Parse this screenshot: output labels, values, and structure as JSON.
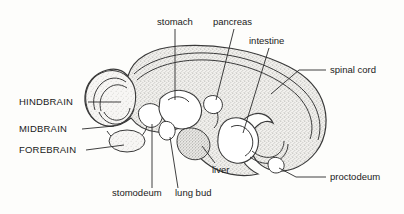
{
  "figure": {
    "background_color": "#fdfdfb",
    "ink_color": "#3a3a3a",
    "stipple_color": "#9a9a96"
  },
  "labels": {
    "stomach": "stomach",
    "pancreas": "pancreas",
    "intestine": "intestine",
    "spinal_cord": "spinal cord",
    "hindbrain": "HINDBRAIN",
    "midbrain": "MIDBRAIN",
    "forebrain": "FOREBRAIN",
    "stomodeum": "stomodeum",
    "lung_bud": "lung bud",
    "liver": "liver",
    "proctodeum": "proctodeum"
  }
}
